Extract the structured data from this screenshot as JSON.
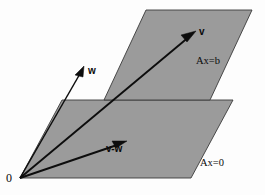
{
  "figure": {
    "background_color": "#fdfdfd",
    "plane_fill_color": "#9b9b9b",
    "plane_edge_color": "#3a3a3a",
    "vector_color": "#0d0d0d"
  },
  "planes": [
    {
      "id": "upper-plane",
      "label": "Ax=b",
      "label_position": "right",
      "points": "104,100 146,10 252,10 210,100"
    },
    {
      "id": "lower-plane",
      "label": "Ax=0",
      "label_position": "right",
      "points": "20,178 62,100 233,100 191,178"
    }
  ],
  "vectors": [
    {
      "id": "vector-v",
      "label": "v",
      "from": [
        20,
        178
      ],
      "to": [
        196,
        31
      ]
    },
    {
      "id": "vector-w",
      "label": "w",
      "from": [
        20,
        178
      ],
      "to": [
        84,
        66
      ]
    },
    {
      "id": "vector-v-minus-w",
      "label": "v-w",
      "from": [
        20,
        178
      ],
      "to": [
        127,
        141
      ]
    }
  ],
  "origin": {
    "label": "0",
    "position": [
      20,
      178
    ]
  }
}
